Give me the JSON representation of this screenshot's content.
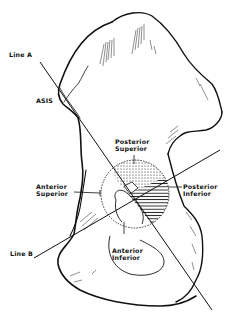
{
  "figure": {
    "type": "anatomical line drawing",
    "colors": {
      "ink": "#111111",
      "background": "#ffffff"
    }
  },
  "labels": {
    "line_a": "Line A",
    "line_b": "Line B",
    "asis": "ASIS",
    "posterior_superior": [
      "Posterior",
      "Superior"
    ],
    "posterior_inferior": [
      "Posterior",
      "Inferior"
    ],
    "anterior_superior": [
      "Anterior",
      "Superior"
    ],
    "anterior_inferior": [
      "Anterior",
      "Inferior"
    ]
  },
  "quadrants": [
    {
      "name": "Posterior Superior",
      "fill": "dotted"
    },
    {
      "name": "Posterior Inferior",
      "fill": "hatched"
    },
    {
      "name": "Anterior Superior",
      "fill": "none"
    },
    {
      "name": "Anterior Inferior",
      "fill": "none"
    }
  ]
}
